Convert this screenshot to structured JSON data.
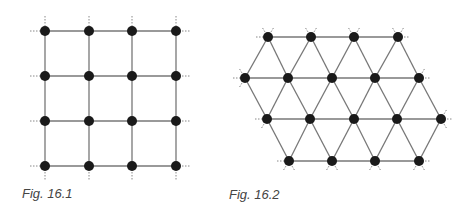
{
  "figures": [
    {
      "id": "fig-16-1",
      "caption": "Fig. 16.1",
      "type": "square-lattice",
      "rows": 4,
      "cols": 4,
      "nodes_x": [
        45,
        89,
        132,
        176
      ],
      "nodes_y": [
        31,
        76,
        121,
        166
      ],
      "caption_pos": [
        22,
        186
      ]
    },
    {
      "id": "fig-16-2",
      "caption": "Fig. 16.2",
      "type": "triangular-lattice",
      "rows": [
        {
          "y": 37,
          "x": [
            268,
            311,
            354,
            398
          ]
        },
        {
          "y": 78,
          "x": [
            245,
            288,
            332,
            375,
            419
          ]
        },
        {
          "y": 119,
          "x": [
            267,
            310,
            354,
            397,
            441
          ]
        },
        {
          "y": 161,
          "x": [
            289,
            332,
            375,
            419
          ]
        }
      ],
      "caption_pos": [
        229,
        187
      ]
    }
  ],
  "style": {
    "node_color": "#1a1a1a",
    "edge_color": "#777777",
    "dotted_color": "#888888",
    "node_radius": 5
  }
}
